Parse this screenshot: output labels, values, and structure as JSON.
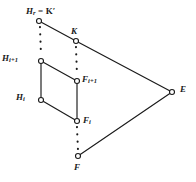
{
  "figure": {
    "background_color": "#ffffff",
    "stroke_color": "#1a1a1a",
    "width": 196,
    "height": 182,
    "vertices": [
      {
        "id": "Hr",
        "name": "vertex-hr",
        "x": 39,
        "y": 21,
        "marker": "open-circle",
        "label_main": "H",
        "label_sub": "r",
        "label_tail": " = K′"
      },
      {
        "id": "K",
        "name": "vertex-k",
        "x": 76,
        "y": 41,
        "marker": "open-circle",
        "label_main": "K",
        "label_sub": "",
        "label_tail": ""
      },
      {
        "id": "Hi1",
        "name": "vertex-hi1",
        "x": 41,
        "y": 61,
        "marker": "open-circle",
        "label_main": "H",
        "label_sub": "i+1",
        "label_tail": ""
      },
      {
        "id": "Fi1",
        "name": "vertex-fi1",
        "x": 77,
        "y": 81,
        "marker": "open-circle",
        "label_main": "F",
        "label_sub": "i+1",
        "label_tail": ""
      },
      {
        "id": "Hi",
        "name": "vertex-hi",
        "x": 41,
        "y": 100,
        "marker": "open-circle",
        "label_main": "H",
        "label_sub": "i",
        "label_tail": ""
      },
      {
        "id": "Fi",
        "name": "vertex-fi",
        "x": 77,
        "y": 121,
        "marker": "open-circle",
        "label_main": "F",
        "label_sub": "i",
        "label_tail": ""
      },
      {
        "id": "F",
        "name": "vertex-f",
        "x": 78,
        "y": 156,
        "marker": "open-circle",
        "label_main": "F",
        "label_sub": "",
        "label_tail": ""
      },
      {
        "id": "E",
        "name": "vertex-e",
        "x": 172,
        "y": 92,
        "marker": "open-circle",
        "label_main": "E",
        "label_sub": "",
        "label_tail": ""
      }
    ],
    "edges": [
      {
        "name": "edge-hr-k",
        "from": "Hr",
        "to": "K",
        "style": "solid"
      },
      {
        "name": "edge-k-e",
        "from": "K",
        "to": "E",
        "style": "solid"
      },
      {
        "name": "edge-hi1-fi1",
        "from": "Hi1",
        "to": "Fi1",
        "style": "solid"
      },
      {
        "name": "edge-hi-fi",
        "from": "Hi",
        "to": "Fi",
        "style": "solid"
      },
      {
        "name": "edge-f-e",
        "from": "F",
        "to": "E",
        "style": "solid"
      },
      {
        "name": "edge-hi1-hi",
        "from": "Hi1",
        "to": "Hi",
        "style": "solid"
      },
      {
        "name": "edge-fi1-fi",
        "from": "Fi1",
        "to": "Fi",
        "style": "solid"
      },
      {
        "name": "edge-hr-hi1",
        "from": "Hr",
        "to": "Hi1",
        "style": "dotted"
      },
      {
        "name": "edge-k-fi1",
        "from": "K",
        "to": "Fi1",
        "style": "dotted"
      },
      {
        "name": "edge-fi-f",
        "from": "Fi",
        "to": "F",
        "style": "dotted"
      }
    ],
    "labels": {
      "hr": {
        "text": "Hᵣ = K′",
        "main": "H",
        "sub": "r",
        "tail": " = K′"
      },
      "k": {
        "text": "K",
        "main": "K",
        "sub": "",
        "tail": ""
      },
      "hi1": {
        "text": "Hᵢ₊₁",
        "main": "H",
        "sub": "i+1",
        "tail": ""
      },
      "fi1": {
        "text": "Fᵢ₊₁",
        "main": "F",
        "sub": "i+1",
        "tail": ""
      },
      "hi": {
        "text": "Hᵢ",
        "main": "H",
        "sub": "i",
        "tail": ""
      },
      "fi": {
        "text": "Fᵢ",
        "main": "F",
        "sub": "i",
        "tail": ""
      },
      "f": {
        "text": "F",
        "main": "F",
        "sub": "",
        "tail": ""
      },
      "e": {
        "text": "E",
        "main": "E",
        "sub": "",
        "tail": ""
      }
    }
  }
}
